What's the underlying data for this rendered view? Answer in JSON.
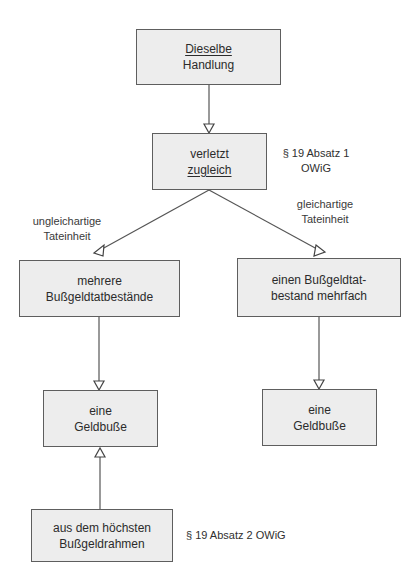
{
  "diagram": {
    "top_fragment": "",
    "colors": {
      "box_fill": "#ededed",
      "box_border": "#5e5e5e",
      "line": "#555555",
      "text": "#2b2b2b"
    },
    "nodes": {
      "same_act": {
        "line1": "Dieselbe",
        "line2": "Handlung"
      },
      "violates": {
        "line1": "verletzt",
        "line2": "zugleich"
      },
      "multiple_offences": {
        "line1": "mehrere",
        "line2": "Bußgeldtatbestände"
      },
      "one_offence_multiple": {
        "line1": "einen Bußgeldtat-",
        "line2": "bestand mehrfach"
      },
      "fine_left": {
        "line1": "eine",
        "line2": "Geldbuße"
      },
      "fine_right": {
        "line1": "eine",
        "line2": "Geldbuße"
      },
      "highest_range": {
        "line1": "aus dem höchsten",
        "line2": "Bußgeldrahmen"
      }
    },
    "edge_labels": {
      "unlike": {
        "line1": "ungleichartige",
        "line2": "Tateinheit"
      },
      "like": {
        "line1": "gleichartige",
        "line2": "Tateinheit"
      }
    },
    "references": {
      "para1": {
        "line1": "§ 19 Absatz 1",
        "line2": "OWiG"
      },
      "para2": "§ 19 Absatz 2 OWiG"
    },
    "edges": [
      {
        "from": "same_act",
        "to": "violates"
      },
      {
        "from": "violates",
        "to": "multiple_offences",
        "label": "unlike"
      },
      {
        "from": "violates",
        "to": "one_offence_multiple",
        "label": "like"
      },
      {
        "from": "multiple_offences",
        "to": "fine_left"
      },
      {
        "from": "one_offence_multiple",
        "to": "fine_right"
      },
      {
        "from": "highest_range",
        "to": "fine_left"
      }
    ]
  }
}
